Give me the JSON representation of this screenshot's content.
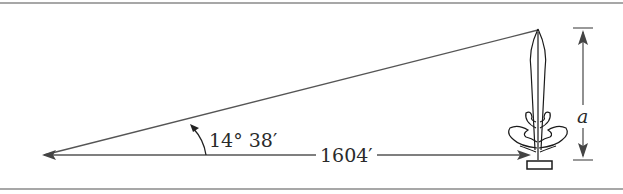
{
  "figure": {
    "type": "right-triangle-elevation-diagram",
    "labels": {
      "angle": "14° 38′",
      "distance": "1604′",
      "height": "a"
    },
    "objects": [
      "observer-point",
      "sight-line",
      "ground-line",
      "tree",
      "height-dimension"
    ],
    "colors": {
      "line": "#555555",
      "tree_outline": "#1a1a1a",
      "rule": "#8a8a8a",
      "text": "#2a2a2a"
    }
  }
}
